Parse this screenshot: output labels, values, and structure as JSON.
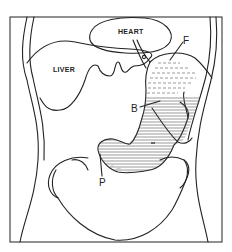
{
  "figure": {
    "type": "anatomical-diagram",
    "labels": {
      "heart": "HEART",
      "liver": "LIVER",
      "fundus": "F",
      "body": "B",
      "pylorus": "P"
    },
    "colors": {
      "line": "#222222",
      "background": "#ffffff",
      "pylorus_shade": "#d8d8d8"
    }
  }
}
